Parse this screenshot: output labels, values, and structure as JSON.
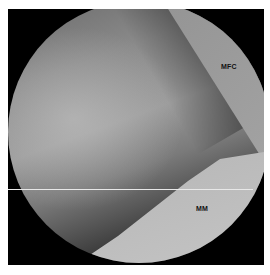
{
  "image": {
    "description": "Arthroscopic view of knee joint",
    "labels": {
      "mfc": "MFC",
      "mm": "MM"
    }
  }
}
